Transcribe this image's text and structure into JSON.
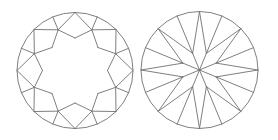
{
  "figure": {
    "width": 278,
    "height": 140,
    "background": "#ffffff",
    "stroke_color": "#707070",
    "stroke_width": 0.9
  },
  "views": [
    {
      "id": "crown",
      "center": [
        75,
        70.5
      ],
      "girdle_radius": 58,
      "table_radius": 32.5,
      "star_radius": 44,
      "facets": {
        "table": 1,
        "star": 8,
        "bezel": 8,
        "upper_girdle": 16
      }
    },
    {
      "id": "pavilion",
      "center": [
        199.5,
        70
      ],
      "girdle_radius": 58.5,
      "inner_point_radius": 18,
      "facets": {
        "pavilion_main": 8,
        "lower_girdle": 16,
        "culet": 1
      }
    }
  ]
}
